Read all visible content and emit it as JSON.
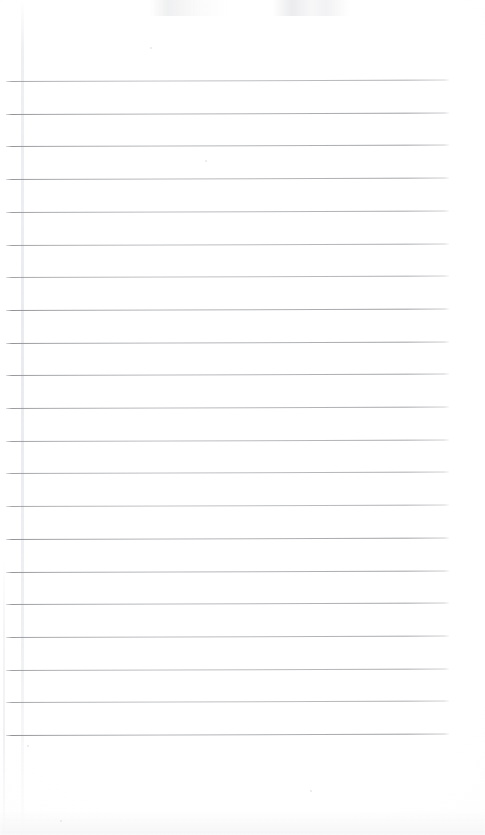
{
  "document": {
    "type": "scanned-ruled-notebook-page",
    "title": "Blank lined notebook page",
    "page_width": 485,
    "page_height": 835,
    "background_color": "#ffffff",
    "text_content": "",
    "handwriting_present": "no",
    "printed_text_present": "no"
  },
  "ruling": {
    "line_color": "#8f9094",
    "line_thickness_px": 1,
    "line_count": 21,
    "first_line_y": 81,
    "line_spacing_px": 32.7,
    "line_start_x": 6,
    "line_end_x": 449,
    "line_tilt_deg": -0.18,
    "lines_y": [
      81,
      113.7,
      146.4,
      179.1,
      211.8,
      244.5,
      277.2,
      309.9,
      342.6,
      375.3,
      408,
      440.7,
      473.4,
      506.1,
      538.8,
      571.5,
      604.2,
      636.9,
      669.6,
      702.3,
      735
    ]
  },
  "margin_rule": {
    "present": "yes",
    "orientation": "vertical",
    "x": 22,
    "color": "#ebecef"
  },
  "artifacts": {
    "top_smudge": "faint gray scanner smudges along the top edge",
    "bottom_smudge": "faint gray shading along the bottom edge",
    "left_crease": "faint vertical crease near the left edge",
    "specks": [
      {
        "x": 205,
        "y": 160,
        "size": 2
      },
      {
        "x": 150,
        "y": 47,
        "size": 2
      },
      {
        "x": 27,
        "y": 745,
        "size": 2
      },
      {
        "x": 310,
        "y": 790,
        "size": 2
      },
      {
        "x": 60,
        "y": 820,
        "size": 2
      }
    ]
  }
}
